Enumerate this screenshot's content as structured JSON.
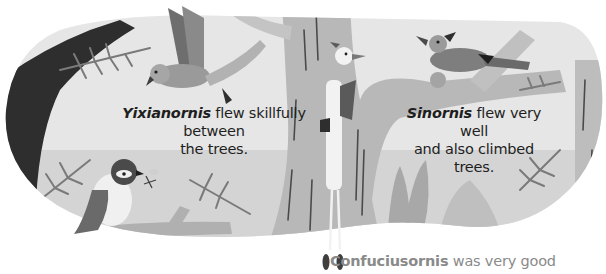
{
  "page": {
    "type": "illustrated-book-page",
    "palette": {
      "background": "#ffffff",
      "panel_sky": "#e4e4e4",
      "panel_ground": "#cfcfcf",
      "tree_trunk": "#b4b4b4",
      "dark_tree": "#2e2e2e",
      "foliage": "#7a7a7a",
      "bark_lines": "#4a4a4a",
      "text": "#1e1e1e",
      "text_faded": "#8a8a8a"
    }
  },
  "captions": {
    "yixianornis": {
      "name": "Yixianornis",
      "line1_rest": " flew skillfully between",
      "line2": "the trees."
    },
    "sinornis": {
      "name": "Sinornis",
      "line1_rest": " flew very well",
      "line2": "and also climbed trees."
    },
    "confuciusornis": {
      "name": "Confuciusornis",
      "rest": " was very good"
    }
  },
  "figures": [
    {
      "id": "yixianornis-flying",
      "label": "Yixianornis bird in flight"
    },
    {
      "id": "sinornis-perched",
      "label": "Sinornis bird perched on branch"
    },
    {
      "id": "bird-with-insect",
      "label": "Small bird holding insect"
    },
    {
      "id": "climbing-bird",
      "label": "Bird climbing tree trunk"
    }
  ]
}
